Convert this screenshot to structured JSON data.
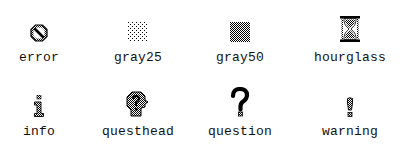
{
  "bitmaps": [
    {
      "name": "error",
      "icon": "error-icon"
    },
    {
      "name": "gray25",
      "icon": "gray25-icon"
    },
    {
      "name": "gray50",
      "icon": "gray50-icon"
    },
    {
      "name": "hourglass",
      "icon": "hourglass-icon"
    },
    {
      "name": "info",
      "icon": "info-icon"
    },
    {
      "name": "questhead",
      "icon": "questhead-icon"
    },
    {
      "name": "question",
      "icon": "question-icon"
    },
    {
      "name": "warning",
      "icon": "warning-icon"
    }
  ],
  "colors": {
    "foreground": "#000000",
    "background": "#ffffff",
    "label": "#111111"
  }
}
